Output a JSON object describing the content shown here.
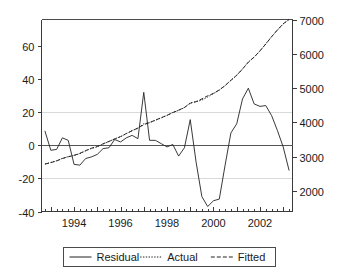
{
  "chart_data": {
    "type": "line",
    "title": "",
    "subtitle": "",
    "xlabel": "",
    "ylabel": "",
    "grid": true,
    "legend_position": "bottom",
    "x": [
      1992.75,
      1993.0,
      1993.25,
      1993.5,
      1993.75,
      1994.0,
      1994.25,
      1994.5,
      1994.75,
      1995.0,
      1995.25,
      1995.5,
      1995.75,
      1996.0,
      1996.25,
      1996.5,
      1996.75,
      1997.0,
      1997.25,
      1997.5,
      1997.75,
      1998.0,
      1998.25,
      1998.5,
      1998.75,
      1999.0,
      1999.25,
      1999.5,
      1999.75,
      2000.0,
      2000.25,
      2000.5,
      2000.75,
      2001.0,
      2001.25,
      2001.5,
      2001.75,
      2002.0,
      2002.25,
      2002.5,
      2002.75,
      2003.0,
      2003.25
    ],
    "x_tick_labels": [
      "1994",
      "1996",
      "1998",
      "2000",
      "2002"
    ],
    "x_tick_values": [
      1994,
      1996,
      1998,
      2000,
      2002
    ],
    "xlim": [
      1992.6,
      2003.4
    ],
    "left_axis": {
      "label": "",
      "ticks": [
        -40,
        -20,
        0,
        20,
        40,
        60
      ],
      "tick_labels": [
        "-40",
        "-20",
        "0",
        "20",
        "40",
        "60"
      ],
      "lim": [
        -40,
        76
      ]
    },
    "right_axis": {
      "label": "",
      "ticks": [
        2000,
        3000,
        4000,
        5000,
        6000,
        7000
      ],
      "tick_labels": [
        "2000",
        "3000",
        "4000",
        "5000",
        "6000",
        "7000"
      ],
      "lim": [
        1400,
        7000
      ]
    },
    "gridline_values_left": [
      20,
      -20
    ],
    "zero_line_value": 0,
    "series": [
      {
        "name": "Residual",
        "axis": "left",
        "style": "solid",
        "color": "#222222",
        "values": [
          8.5,
          -3.0,
          -2.5,
          4.5,
          3.0,
          -11.5,
          -12.0,
          -8.0,
          -7.0,
          -5.5,
          -2.0,
          -1.5,
          3.5,
          2.0,
          4.5,
          6.0,
          4.0,
          32.0,
          3.0,
          3.0,
          1.0,
          -1.0,
          0.5,
          -6.5,
          -1.5,
          15.5,
          -10.0,
          -31.0,
          -37.0,
          -33.5,
          -32.5,
          -12.0,
          7.5,
          13.0,
          28.0,
          34.5,
          25.0,
          23.5,
          24.0,
          18.0,
          9.0,
          -1.0,
          -15.0
        ]
      },
      {
        "name": "Actual",
        "axis": "right",
        "style": "dotted",
        "color": "#1d1d1d",
        "values": [
          2790,
          2830,
          2880,
          2950,
          3000,
          3030,
          3090,
          3170,
          3240,
          3290,
          3370,
          3440,
          3520,
          3580,
          3670,
          3760,
          3830,
          3960,
          3990,
          4060,
          4130,
          4200,
          4290,
          4350,
          4430,
          4570,
          4600,
          4650,
          4740,
          4840,
          4940,
          5070,
          5230,
          5370,
          5560,
          5760,
          5900,
          6080,
          6290,
          6500,
          6690,
          6870,
          7000
        ]
      },
      {
        "name": "Fitted",
        "axis": "right",
        "style": "dashed",
        "color": "#1d1d1d",
        "values": [
          2780,
          2825,
          2875,
          2945,
          2995,
          3040,
          3095,
          3175,
          3245,
          3295,
          3375,
          3445,
          3515,
          3585,
          3675,
          3755,
          3835,
          3930,
          3995,
          4065,
          4135,
          4205,
          4285,
          4355,
          4435,
          4555,
          4605,
          4685,
          4775,
          4845,
          4945,
          5075,
          5225,
          5375,
          5555,
          5755,
          5905,
          6085,
          6285,
          6495,
          6695,
          6875,
          7000
        ]
      }
    ],
    "annotations": []
  },
  "legend": {
    "entries": [
      {
        "label": "Residual",
        "style": "solid"
      },
      {
        "label": "Actual",
        "style": "dotted"
      },
      {
        "label": "Fitted",
        "style": "dashed"
      }
    ]
  },
  "colors": {
    "background": "#ffffff",
    "axis": "#3a3a3a",
    "grid": "#d9d9d9",
    "series": "#222222"
  }
}
